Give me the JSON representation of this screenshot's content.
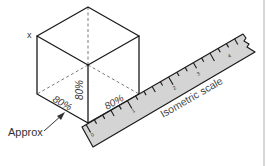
{
  "diagram": {
    "vertex_label": "x",
    "face_labels": {
      "left": "80%",
      "vertical": "80%",
      "right": "80%"
    },
    "annotation": "Approx",
    "scale": {
      "label": "Isometric scale",
      "numbers": [
        "0",
        "1",
        "2",
        "3",
        "4"
      ]
    },
    "colors": {
      "line": "#1a1a1a",
      "ruler_fill": "#d4d4d4",
      "background": "#ffffff"
    }
  }
}
